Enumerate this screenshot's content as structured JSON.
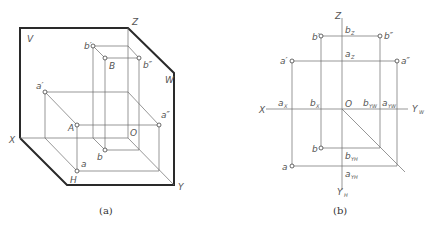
{
  "figure_a": {
    "caption": "(a)",
    "planes": {
      "V": "V",
      "W": "W",
      "H": "H"
    },
    "axes": {
      "X": "X",
      "Y": "Y",
      "Z": "Z",
      "origin": "O"
    },
    "points": {
      "A": "A",
      "a": "a",
      "a_prime": "a′",
      "a_double_prime": "a″",
      "B": "B",
      "b": "b",
      "b_prime": "b′",
      "b_double_prime": "b″"
    }
  },
  "figure_b": {
    "caption": "(b)",
    "axes": {
      "X": "X",
      "Z": "Z",
      "origin": "O",
      "YW": "Y",
      "YW_sub": "W",
      "YH": "Y",
      "YH_sub": "H"
    },
    "points": {
      "a": "a",
      "a_prime": "a′",
      "a_double_prime": "a″",
      "b": "b",
      "b_prime": "b′",
      "b_double_prime": "b″"
    },
    "axis_marks": {
      "aX": "a",
      "aX_sub": "X",
      "bX": "b",
      "bX_sub": "X",
      "aZ": "a",
      "aZ_sub": "Z",
      "bZ": "b",
      "bZ_sub": "Z",
      "aYW": "a",
      "aYW_sub": "YW",
      "bYW": "b",
      "bYW_sub": "YW",
      "aYH": "a",
      "aYH_sub": "YH",
      "bYH": "b",
      "bYH_sub": "YH"
    }
  },
  "colors": {
    "line": "#6a6a6a",
    "outline": "#2a2a2a",
    "text": "#555555",
    "background": "#ffffff"
  }
}
